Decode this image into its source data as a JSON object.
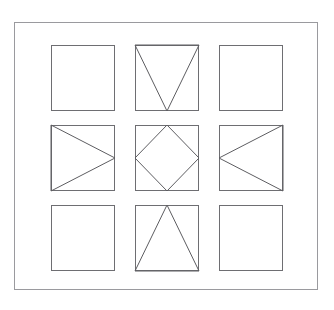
{
  "figure": {
    "kind": "matrix-figure",
    "top_text_artifact": "",
    "frame": {
      "name": "outer-border",
      "x": 14,
      "y": 22,
      "width": 304,
      "height": 268,
      "stroke_color": "#9a9a9e",
      "background_color": "#ffffff"
    },
    "page_background": "#ffffff",
    "grid": {
      "rows": 3,
      "columns": 3,
      "cell_width": 64,
      "cell_height": 66,
      "column_gap": 20,
      "row_gap": 14,
      "box_stroke_color": "#6e6e72",
      "shape_stroke_color": "#5d5d61",
      "stroke_width": 1
    },
    "cells": [
      {
        "index": 0,
        "row": 0,
        "column": 0,
        "position": "top-left",
        "name": "cell-top-left",
        "shape": "none",
        "shape_label": "empty square",
        "points": ""
      },
      {
        "index": 1,
        "row": 0,
        "column": 1,
        "position": "top-center",
        "name": "cell-top-center",
        "shape": "triangle-down",
        "shape_label": "downward triangle",
        "points": "0,0 64,0 32,66"
      },
      {
        "index": 2,
        "row": 0,
        "column": 2,
        "position": "top-right",
        "name": "cell-top-right",
        "shape": "none",
        "shape_label": "empty square",
        "points": ""
      },
      {
        "index": 3,
        "row": 1,
        "column": 0,
        "position": "middle-left",
        "name": "cell-middle-left",
        "shape": "triangle-right",
        "shape_label": "rightward triangle",
        "points": "0,0 64,33 0,66"
      },
      {
        "index": 4,
        "row": 1,
        "column": 1,
        "position": "middle-center",
        "name": "cell-middle-center",
        "shape": "diamond",
        "shape_label": "diamond inscribed in square",
        "points": "32,0 64,33 32,66 0,33"
      },
      {
        "index": 5,
        "row": 1,
        "column": 2,
        "position": "middle-right",
        "name": "cell-middle-right",
        "shape": "triangle-left",
        "shape_label": "leftward triangle",
        "points": "64,0 64,66 0,33"
      },
      {
        "index": 6,
        "row": 2,
        "column": 0,
        "position": "bottom-left",
        "name": "cell-bottom-left",
        "shape": "none",
        "shape_label": "empty square",
        "points": ""
      },
      {
        "index": 7,
        "row": 2,
        "column": 1,
        "position": "bottom-center",
        "name": "cell-bottom-center",
        "shape": "triangle-up",
        "shape_label": "upward triangle",
        "points": "32,0 64,66 0,66"
      },
      {
        "index": 8,
        "row": 2,
        "column": 2,
        "position": "bottom-right",
        "name": "cell-bottom-right",
        "shape": "none",
        "shape_label": "empty square",
        "points": ""
      }
    ]
  }
}
